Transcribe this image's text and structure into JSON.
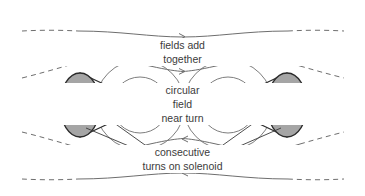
{
  "figure": {
    "background_color": "#ffffff",
    "width": 365,
    "height": 196
  },
  "colors": {
    "field_line": "#6e6e6e",
    "turn_outline": "#2b2b2b",
    "turn_fill": "#a5a5a5",
    "axis_arrow": "#1a1a1a",
    "leader_line": "#3a3a3a",
    "text": "#3b3b3b"
  },
  "labels": {
    "fields_add_line1": "fields add",
    "fields_add_line2": "together",
    "circular_field_line1": "circular",
    "circular_field_line2": "field",
    "circular_field_line3": "near turn",
    "consecutive_turns_line1": "consecutive",
    "consecutive_turns_line2": "turns on solenoid"
  },
  "elements": {
    "left_turn": {
      "name": "left-solenoid-turn",
      "disc_center_x": 80,
      "disc_center_y": 105,
      "disc_rx": 20,
      "disc_ry": 32,
      "apex_x": 140,
      "apex_y": 105
    },
    "right_turn": {
      "name": "right-solenoid-turn",
      "disc_center_x": 287,
      "disc_center_y": 105,
      "disc_rx": 20,
      "disc_ry": 32,
      "apex_x": 228,
      "apex_y": 105
    },
    "axis_arrow_left": {
      "from_x": 20,
      "to_x": 62,
      "y": 105,
      "direction": "right"
    },
    "axis_arrow_right": {
      "from_x": 348,
      "to_x": 306,
      "y": 105,
      "direction": "left"
    },
    "concentric_circles_left": {
      "center_x": 140,
      "center_y": 105,
      "radii": [
        8,
        16,
        27,
        45
      ]
    },
    "concentric_circles_right": {
      "center_x": 228,
      "center_y": 105,
      "radii": [
        8,
        16,
        27,
        45
      ]
    },
    "outer_field_lines": [
      {
        "name": "top-outer-field-line",
        "y": 33,
        "arrow_direction": "right",
        "dashed_ends": true
      },
      {
        "name": "top-inner-field-line",
        "y": 70,
        "arrow_direction": "right",
        "dashed_ends": true
      },
      {
        "name": "bottom-inner-field-line",
        "y": 140,
        "arrow_direction": "left",
        "dashed_ends": true
      },
      {
        "name": "bottom-outer-field-line",
        "y": 177,
        "arrow_direction": "left",
        "dashed_ends": true
      }
    ]
  }
}
